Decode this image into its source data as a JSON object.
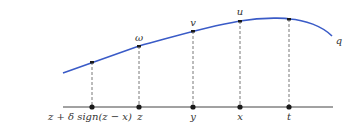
{
  "colors": {
    "curve": "#3a5bc7",
    "axis": "#444444",
    "dashed": "#555555",
    "point": "#1a1a1a",
    "text": "#333333"
  },
  "curve": {
    "label": "q"
  },
  "curve_points": [
    {
      "label": "",
      "x": 92
    },
    {
      "label": "ω",
      "x": 139
    },
    {
      "label": "v",
      "x": 193
    },
    {
      "label": "u",
      "x": 240
    },
    {
      "label": "",
      "x": 289
    }
  ],
  "axis_points": [
    {
      "label": "z + δ sign(z − x)",
      "x": 92
    },
    {
      "label": "z",
      "x": 139
    },
    {
      "label": "y",
      "x": 193
    },
    {
      "label": "x",
      "x": 240
    },
    {
      "label": "t",
      "x": 289
    }
  ]
}
